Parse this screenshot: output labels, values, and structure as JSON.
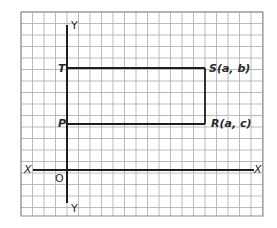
{
  "diagram": {
    "type": "coordinate-grid",
    "grid": {
      "line_color": "#a9a9a9",
      "border_color": "#8a8a8a"
    },
    "axes": {
      "x_label_left": "X",
      "x_label_right": "X",
      "y_label_top": "Y",
      "y_label_bottom": "Y",
      "origin_label": "O"
    },
    "points": {
      "T": "T",
      "P": "P",
      "S": "S(a, b)",
      "R": "R(a, c)"
    },
    "line_color": "#1e1e1e"
  }
}
